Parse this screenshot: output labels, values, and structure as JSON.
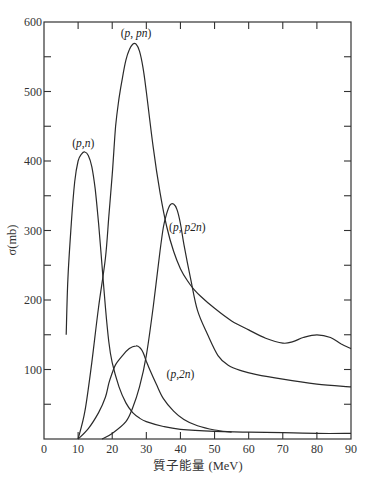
{
  "chart_data": {
    "type": "line",
    "title": "",
    "xlabel": "質子能量 (MeV)",
    "ylabel": "σ(mb)",
    "xlim": [
      0,
      90
    ],
    "ylim": [
      0,
      600
    ],
    "xticks": [
      0,
      10,
      20,
      30,
      40,
      50,
      60,
      70,
      80,
      90
    ],
    "yticks": [
      100,
      200,
      300,
      400,
      500,
      600
    ],
    "y_minor_ticks": [
      50,
      150,
      250,
      350,
      450,
      550
    ],
    "grid": false,
    "legend": "none (inline curve labels)",
    "series": [
      {
        "name": "(p,n)",
        "label_parts": [
          "(",
          "p",
          ",",
          "n",
          ")"
        ],
        "label_pos": [
          11.5,
          420
        ],
        "points": [
          [
            6.5,
            150
          ],
          [
            7,
            230
          ],
          [
            8,
            310
          ],
          [
            9,
            370
          ],
          [
            10,
            400
          ],
          [
            11,
            410
          ],
          [
            12,
            413
          ],
          [
            13,
            408
          ],
          [
            14,
            392
          ],
          [
            15,
            360
          ],
          [
            16,
            310
          ],
          [
            17,
            250
          ],
          [
            18,
            190
          ],
          [
            19,
            140
          ],
          [
            20,
            110
          ],
          [
            22,
            75
          ],
          [
            24,
            52
          ],
          [
            26,
            38
          ],
          [
            28,
            30
          ],
          [
            30,
            25
          ],
          [
            35,
            18
          ],
          [
            40,
            14
          ],
          [
            50,
            11
          ],
          [
            60,
            10
          ],
          [
            70,
            9
          ],
          [
            80,
            8
          ],
          [
            90,
            8
          ]
        ]
      },
      {
        "name": "(p,pn)",
        "label_parts": [
          "(",
          "p",
          ", ",
          "pn",
          ")"
        ],
        "label_pos": [
          27,
          578
        ],
        "points": [
          [
            10,
            0
          ],
          [
            12,
            40
          ],
          [
            14,
            110
          ],
          [
            16,
            190
          ],
          [
            18,
            260
          ],
          [
            19,
            320
          ],
          [
            20,
            380
          ],
          [
            21,
            450
          ],
          [
            22,
            490
          ],
          [
            23,
            520
          ],
          [
            24,
            545
          ],
          [
            25,
            560
          ],
          [
            26,
            568
          ],
          [
            27,
            568
          ],
          [
            28,
            558
          ],
          [
            29,
            535
          ],
          [
            30,
            500
          ],
          [
            32,
            420
          ],
          [
            34,
            355
          ],
          [
            36,
            305
          ],
          [
            38,
            270
          ],
          [
            40,
            245
          ],
          [
            42,
            228
          ],
          [
            44,
            215
          ],
          [
            46,
            205
          ],
          [
            50,
            188
          ],
          [
            55,
            170
          ],
          [
            60,
            157
          ],
          [
            65,
            145
          ],
          [
            70,
            138
          ],
          [
            73,
            140
          ],
          [
            76,
            146
          ],
          [
            80,
            150
          ],
          [
            84,
            146
          ],
          [
            87,
            137
          ],
          [
            90,
            130
          ]
        ]
      },
      {
        "name": "(p,p2n)",
        "label_parts": [
          "(",
          "p",
          ", ",
          "p2n",
          ")"
        ],
        "label_pos": [
          42,
          300
        ],
        "points": [
          [
            17,
            0
          ],
          [
            20,
            8
          ],
          [
            24,
            25
          ],
          [
            26,
            45
          ],
          [
            28,
            75
          ],
          [
            30,
            120
          ],
          [
            32,
            190
          ],
          [
            34,
            270
          ],
          [
            35,
            305
          ],
          [
            36,
            325
          ],
          [
            37,
            337
          ],
          [
            38,
            338
          ],
          [
            39,
            330
          ],
          [
            40,
            310
          ],
          [
            41,
            280
          ],
          [
            43,
            230
          ],
          [
            45,
            185
          ],
          [
            48,
            150
          ],
          [
            51,
            120
          ],
          [
            54,
            106
          ],
          [
            58,
            98
          ],
          [
            62,
            93
          ],
          [
            70,
            86
          ],
          [
            80,
            79
          ],
          [
            90,
            75
          ]
        ]
      },
      {
        "name": "(p,2n)",
        "label_parts": [
          "(",
          "p",
          ",",
          "2n",
          ")"
        ],
        "label_pos": [
          40,
          88
        ],
        "points": [
          [
            10,
            0
          ],
          [
            13,
            15
          ],
          [
            16,
            38
          ],
          [
            18,
            60
          ],
          [
            19,
            80
          ],
          [
            20,
            95
          ],
          [
            21,
            107
          ],
          [
            23,
            120
          ],
          [
            25,
            130
          ],
          [
            27,
            134
          ],
          [
            28,
            132
          ],
          [
            29,
            125
          ],
          [
            30,
            112
          ],
          [
            31,
            100
          ],
          [
            33,
            78
          ],
          [
            35,
            58
          ],
          [
            38,
            40
          ],
          [
            41,
            28
          ],
          [
            45,
            19
          ],
          [
            50,
            13
          ],
          [
            55,
            10
          ]
        ]
      }
    ]
  },
  "axes": {
    "x_tick_labels": [
      "0",
      "10",
      "20",
      "30",
      "40",
      "50",
      "60",
      "70",
      "80",
      "90"
    ],
    "y_tick_labels": [
      "100",
      "200",
      "300",
      "400",
      "500",
      "600"
    ],
    "x_title": "質子能量 (MeV)",
    "y_title": "σ(mb)"
  }
}
